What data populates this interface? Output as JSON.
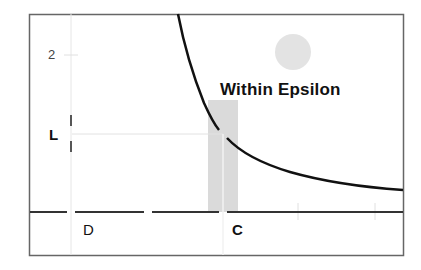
{
  "diagram": {
    "title_label": "Within Epsilon",
    "y_tick_label": "2",
    "labels": {
      "L": "L",
      "D": "D",
      "C": "C"
    },
    "colors": {
      "frame": "#555555",
      "axis": "#333333",
      "curve": "#111111",
      "shade": "#d9d9d9",
      "circle": "#e2e2e2",
      "guide": "#e8e8e8"
    }
  }
}
